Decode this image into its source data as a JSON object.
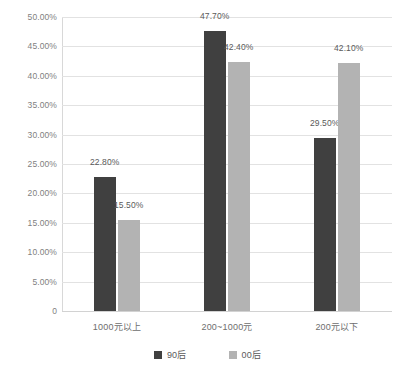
{
  "chart_data": {
    "type": "bar",
    "title": "",
    "subtitle": "",
    "xlabel": "",
    "ylabel": "",
    "categories": [
      "1000元以上",
      "200~1000元",
      "200元以下"
    ],
    "series": [
      {
        "name": "90后",
        "color": "#404040",
        "values": [
          22.8,
          47.7,
          29.5
        ],
        "labels": [
          "22.80%",
          "47.70%",
          "29.50%"
        ]
      },
      {
        "name": "00后",
        "color": "#b3b3b3",
        "values": [
          15.5,
          42.4,
          42.1
        ],
        "labels": [
          "15.50%",
          "42.40%",
          "42.10%"
        ]
      }
    ],
    "ylim": [
      0,
      50
    ],
    "ytick_values": [
      0,
      5,
      10,
      15,
      20,
      25,
      30,
      35,
      40,
      45,
      50
    ],
    "ytick_labels": [
      "0",
      "5.00%",
      "10.00%",
      "15.00%",
      "20.00%",
      "25.00%",
      "30.00%",
      "35.00%",
      "40.00%",
      "45.00%",
      "50.00%"
    ],
    "grid": "horizontal",
    "legend_position": "bottom",
    "value_labels_shown": true,
    "unit": "%"
  },
  "legend": {
    "items": [
      {
        "label": "90后",
        "color": "#404040"
      },
      {
        "label": "00后",
        "color": "#b3b3b3"
      }
    ]
  },
  "colors": {
    "series_90": "#404040",
    "series_00": "#b3b3b3",
    "gridline": "#e2e2e2",
    "axis": "#d8d8d8",
    "tick_text": "#7f7f7f",
    "label_text": "#5a5a5a",
    "background": "#ffffff"
  }
}
